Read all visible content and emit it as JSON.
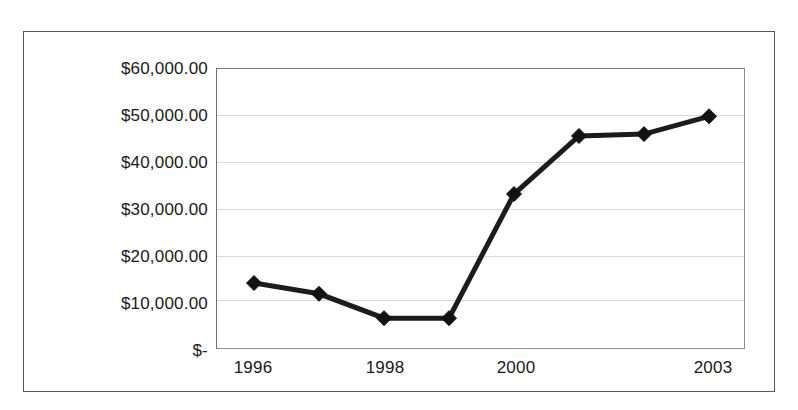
{
  "chart_data": {
    "type": "line",
    "title": "",
    "subtitle": "",
    "xlabel": "",
    "ylabel": "",
    "categories": [
      "1996",
      "",
      "1998",
      "",
      "2000",
      "",
      "",
      "2003"
    ],
    "x_tick_labels": [
      {
        "index": 0,
        "label": "1996"
      },
      {
        "index": 2,
        "label": "1998"
      },
      {
        "index": 4,
        "label": "2000"
      },
      {
        "index": 7,
        "label": "2003"
      }
    ],
    "values": [
      14300,
      12000,
      6800,
      6800,
      33300,
      45700,
      46100,
      49900
    ],
    "series": [
      {
        "name": "",
        "values": [
          14300,
          12000,
          6800,
          6800,
          33300,
          45700,
          46100,
          49900
        ]
      }
    ],
    "ylim": [
      0,
      60000
    ],
    "y_ticks": [
      0,
      10000,
      20000,
      30000,
      40000,
      50000,
      60000
    ],
    "y_tick_labels": [
      "$-",
      "$10,000.00",
      "$20,000.00",
      "$30,000.00",
      "$40,000.00",
      "$50,000.00",
      "$60,000.00"
    ],
    "grid": true,
    "grid_axis": "y",
    "legend": false,
    "legend_position": "none",
    "marker": "diamond",
    "line_color": "#1c1c1c",
    "marker_color": "#121212",
    "gridline_color": "#d9d9d9",
    "plot_border_color": "#8c8c8c",
    "frame_border_color": "#555555",
    "background_color": "#ffffff",
    "annotations": []
  },
  "axes": {
    "y_labels": [
      {
        "value": 60000,
        "text": "$60,000.00"
      },
      {
        "value": 50000,
        "text": "$50,000.00"
      },
      {
        "value": 40000,
        "text": "$40,000.00"
      },
      {
        "value": 30000,
        "text": "$30,000.00"
      },
      {
        "value": 20000,
        "text": "$20,000.00"
      },
      {
        "value": 10000,
        "text": "$10,000.00"
      },
      {
        "value": 0,
        "text": "$-"
      }
    ],
    "x_labels": [
      {
        "index": 0,
        "text": "1996"
      },
      {
        "index": 2,
        "text": "1998"
      },
      {
        "index": 4,
        "text": "2000"
      },
      {
        "index": 7,
        "text": "2003"
      }
    ]
  }
}
